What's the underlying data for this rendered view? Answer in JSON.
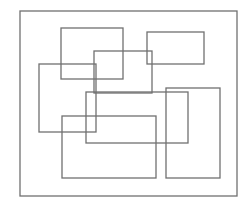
{
  "canvas": {
    "width": 252,
    "height": 210,
    "background": "#ffffff",
    "stroke": "#707070"
  },
  "frame": {
    "x": 20,
    "y": 11,
    "w": 217,
    "h": 185
  },
  "rectangles": [
    {
      "id": "rect-a",
      "x": 61,
      "y": 28,
      "w": 62,
      "h": 51
    },
    {
      "id": "rect-b",
      "x": 147,
      "y": 32,
      "w": 57,
      "h": 32
    },
    {
      "id": "rect-c",
      "x": 94,
      "y": 51,
      "w": 58,
      "h": 42
    },
    {
      "id": "rect-d",
      "x": 39,
      "y": 64,
      "w": 57,
      "h": 68
    },
    {
      "id": "rect-e",
      "x": 166,
      "y": 88,
      "w": 54,
      "h": 90
    },
    {
      "id": "rect-f",
      "x": 86,
      "y": 92,
      "w": 102,
      "h": 51
    },
    {
      "id": "rect-g",
      "x": 62,
      "y": 116,
      "w": 94,
      "h": 62
    }
  ]
}
